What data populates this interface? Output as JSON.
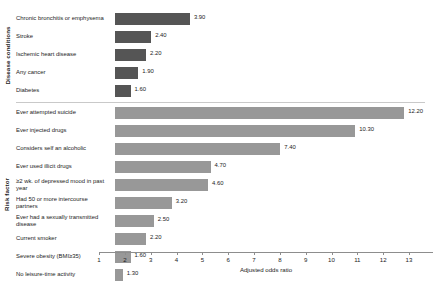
{
  "chart_data": {
    "type": "bar",
    "orientation": "horizontal",
    "title": "",
    "xlabel": "Adjusted odds ratio",
    "ylabel": "",
    "xlim": [
      1,
      13
    ],
    "xticks": [
      1,
      2,
      3,
      4,
      5,
      6,
      7,
      8,
      9,
      10,
      11,
      12,
      13
    ],
    "grid": false,
    "legend": "none",
    "value_format": "2-decimal",
    "group_labels": {
      "disease": "Disease conditions",
      "risk": "Risk factor"
    },
    "colors": {
      "disease_bar": "#555555",
      "risk_bar": "#989898",
      "axis": "#8d8d8d",
      "text": "#1c1c1c",
      "background": "#ffffff"
    },
    "groups": [
      {
        "key": "disease",
        "name": "Disease conditions",
        "categories": [
          "Chronic bronchitis or emphysema",
          "Stroke",
          "Ischemic heart disease",
          "Any cancer",
          "Diabetes"
        ],
        "values": [
          3.9,
          2.4,
          2.2,
          1.9,
          1.6
        ],
        "labels": [
          "3.90",
          "2.40",
          "2.20",
          "1.90",
          "1.60"
        ]
      },
      {
        "key": "risk",
        "name": "Risk factor",
        "categories": [
          "Ever attempted suicide",
          "Ever injected drugs",
          "Considers self an alcoholic",
          "Ever used illicit drugs",
          "≥2 wk. of depressed mood in past  year",
          "Had 50 or more intercourse partners",
          "Ever had a sexually transmitted disease",
          "Current smoker",
          "Severe obesity (BMI≥35)",
          "No leisure-time activity"
        ],
        "values": [
          12.2,
          10.3,
          7.4,
          4.7,
          4.6,
          3.2,
          2.5,
          2.2,
          1.6,
          1.3
        ],
        "labels": [
          "12.20",
          "10.30",
          "7.40",
          "4.70",
          "4.60",
          "3.20",
          "2.50",
          "2.20",
          "1.60",
          "1.30"
        ]
      }
    ]
  }
}
